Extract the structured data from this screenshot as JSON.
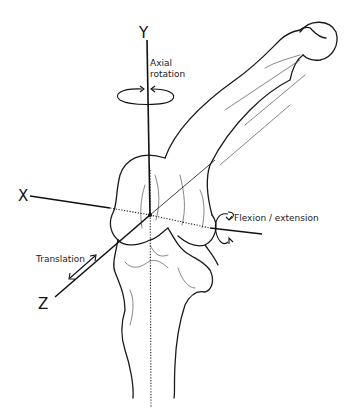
{
  "diagram": {
    "axes": [
      {
        "label": "X"
      },
      {
        "label": "Y"
      },
      {
        "label": "Z"
      }
    ],
    "motions": {
      "axial_rotation_line1": "Axial",
      "axial_rotation_line2": "rotation",
      "flexion_extension": "Flexion / extension",
      "translation": "Translation"
    },
    "colors": {
      "line": "#1a1a1a",
      "background": "#ffffff"
    }
  }
}
